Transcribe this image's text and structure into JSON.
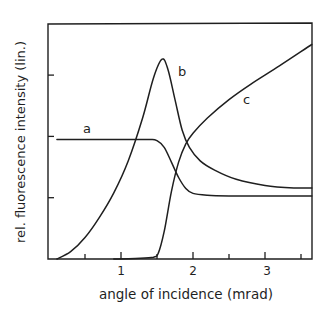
{
  "chart_data": {
    "type": "line",
    "title": "",
    "xlabel": "angle of incidence (mrad)",
    "ylabel": "rel. fluorescence intensity (lin.)",
    "xlim": [
      0,
      3.65
    ],
    "ylim": [
      0,
      3.85
    ],
    "x_ticks_major": [
      1,
      2,
      3
    ],
    "x_tick_labels": [
      "1",
      "2",
      "3"
    ],
    "x_ticks_minor": [
      0.5,
      1.5,
      2.5,
      3.5
    ],
    "y_ticks": [
      1,
      2,
      3
    ],
    "y_tick_labels": [],
    "grid": false,
    "legend": "inline curve labels",
    "series": [
      {
        "name": "a",
        "label_pos": [
          0.53,
          2.08
        ],
        "x": [
          0.11,
          0.5,
          1.0,
          1.4,
          1.5,
          1.6,
          1.7,
          1.8,
          1.9,
          2.0,
          2.2,
          2.5,
          3.0,
          3.65
        ],
        "y": [
          1.95,
          1.95,
          1.95,
          1.95,
          1.93,
          1.82,
          1.58,
          1.33,
          1.15,
          1.07,
          1.04,
          1.03,
          1.03,
          1.03
        ]
      },
      {
        "name": "b",
        "label_pos": [
          1.84,
          3.04
        ],
        "x": [
          0.11,
          0.3,
          0.5,
          0.7,
          0.9,
          1.1,
          1.3,
          1.45,
          1.57,
          1.65,
          1.75,
          1.85,
          1.95,
          2.1,
          2.3,
          2.6,
          3.0,
          3.4,
          3.65
        ],
        "y": [
          0.0,
          0.12,
          0.35,
          0.68,
          1.08,
          1.6,
          2.3,
          2.95,
          3.26,
          3.1,
          2.6,
          2.1,
          1.82,
          1.6,
          1.45,
          1.3,
          1.2,
          1.16,
          1.16
        ]
      },
      {
        "name": "c",
        "label_pos": [
          2.75,
          2.55
        ],
        "x": [
          0.9,
          1.2,
          1.45,
          1.52,
          1.6,
          1.7,
          1.8,
          1.9,
          2.0,
          2.2,
          2.5,
          2.8,
          3.2,
          3.65
        ],
        "y": [
          0.0,
          0.01,
          0.03,
          0.1,
          0.45,
          1.1,
          1.58,
          1.88,
          2.05,
          2.3,
          2.6,
          2.85,
          3.15,
          3.5
        ]
      }
    ]
  },
  "labels": {
    "curve_a": "a",
    "curve_b": "b",
    "curve_c": "c",
    "x_tick_1": "1",
    "x_tick_2": "2",
    "x_tick_3": "3",
    "xlabel": "angle of incidence (mrad)",
    "ylabel": "rel. fluorescence intensity (lin.)"
  },
  "style": {
    "line_color": "#1f1f1f",
    "background": "#ffffff"
  }
}
